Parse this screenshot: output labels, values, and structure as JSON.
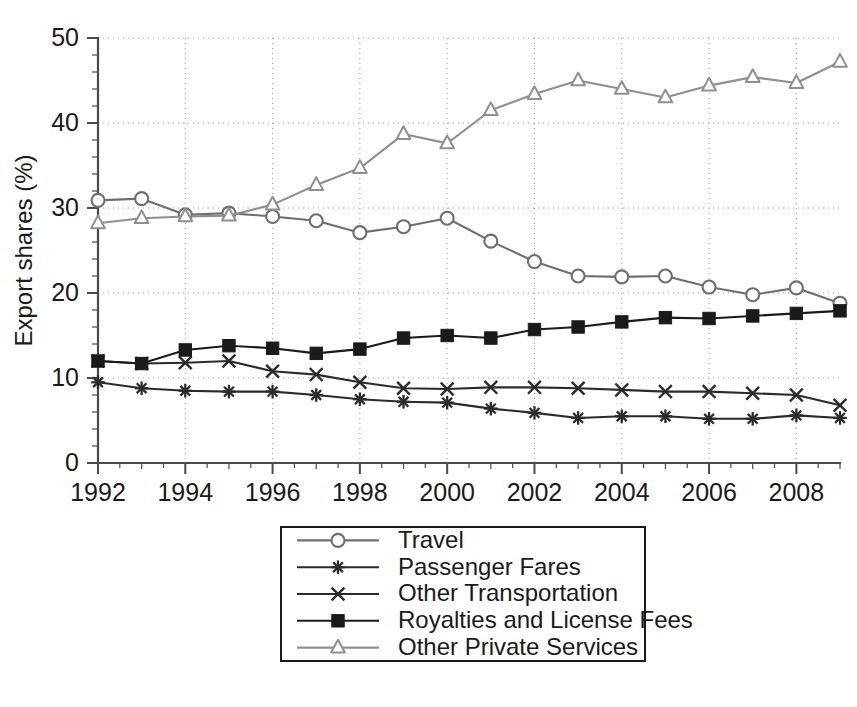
{
  "chart_data": {
    "type": "line",
    "title": "",
    "subtitle": "",
    "xlabel": "",
    "ylabel": "Export shares (%)",
    "xlim": [
      1992,
      2009
    ],
    "ylim": [
      0,
      50
    ],
    "grid": true,
    "legend_position": "bottom-center",
    "x": [
      1992,
      1993,
      1994,
      1995,
      1996,
      1997,
      1998,
      1999,
      2000,
      2001,
      2002,
      2003,
      2004,
      2005,
      2006,
      2007,
      2008,
      2009
    ],
    "x_tick_labels": [
      "1992",
      "1994",
      "1996",
      "1998",
      "2000",
      "2002",
      "2004",
      "2006",
      "2008"
    ],
    "x_tick_values": [
      1992,
      1994,
      1996,
      1998,
      2000,
      2002,
      2004,
      2006,
      2008
    ],
    "y_tick_labels": [
      "0",
      "10",
      "20",
      "30",
      "40",
      "50"
    ],
    "y_tick_values": [
      0,
      10,
      20,
      30,
      40,
      50
    ],
    "series": [
      {
        "name": "Travel",
        "marker": "circle-open",
        "color": "#6e6e6e",
        "values": [
          30.9,
          31.1,
          29.2,
          29.4,
          29.0,
          28.5,
          27.1,
          27.8,
          28.8,
          26.1,
          23.7,
          22.0,
          21.9,
          22.0,
          20.7,
          19.8,
          20.6,
          18.8
        ]
      },
      {
        "name": "Passenger Fares",
        "marker": "asterisk",
        "color": "#2b2b2b",
        "values": [
          9.5,
          8.8,
          8.5,
          8.4,
          8.4,
          8.0,
          7.5,
          7.2,
          7.1,
          6.4,
          5.9,
          5.3,
          5.5,
          5.5,
          5.2,
          5.2,
          5.6,
          5.3
        ]
      },
      {
        "name": "Other Transportation",
        "marker": "x",
        "color": "#2b2b2b",
        "values": [
          12.0,
          11.7,
          11.8,
          12.0,
          10.8,
          10.4,
          9.5,
          8.8,
          8.7,
          8.9,
          8.9,
          8.8,
          8.6,
          8.4,
          8.4,
          8.2,
          8.0,
          6.8
        ]
      },
      {
        "name": "Royalties and License Fees",
        "marker": "square-filled",
        "color": "#1a1a1a",
        "values": [
          12.0,
          11.7,
          13.3,
          13.8,
          13.5,
          12.9,
          13.4,
          14.7,
          15.0,
          14.7,
          15.7,
          16.0,
          16.6,
          17.1,
          17.0,
          17.3,
          17.6,
          17.9
        ]
      },
      {
        "name": "Other Private Services",
        "marker": "triangle-open",
        "color": "#8f8f8f",
        "values": [
          28.2,
          28.8,
          29.0,
          29.1,
          30.4,
          32.7,
          34.7,
          38.7,
          37.6,
          41.5,
          43.4,
          45.0,
          44.0,
          43.0,
          44.4,
          45.4,
          44.7,
          47.2
        ]
      }
    ]
  },
  "axes": {
    "y_axis_title": "Export shares (%)"
  },
  "legend": {
    "items": [
      {
        "label": "Travel"
      },
      {
        "label": "Passenger Fares"
      },
      {
        "label": "Other Transportation"
      },
      {
        "label": "Royalties and License Fees"
      },
      {
        "label": "Other Private Services"
      }
    ]
  }
}
